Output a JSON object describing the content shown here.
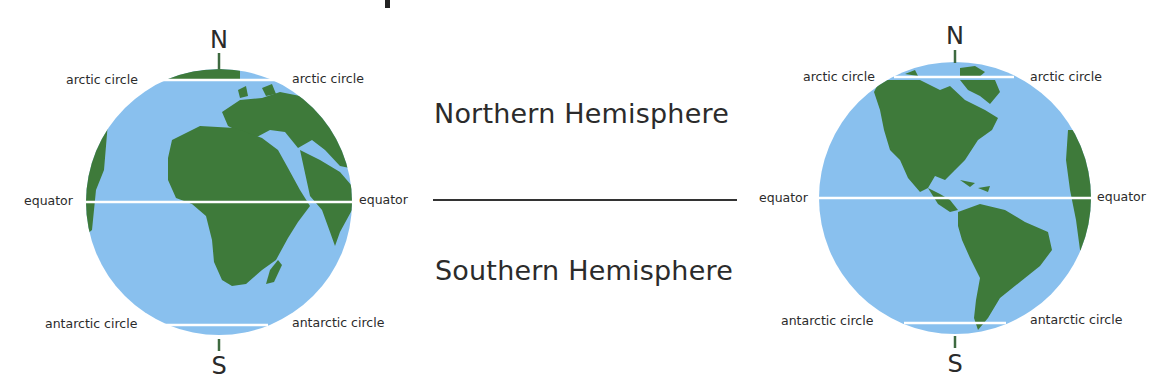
{
  "colors": {
    "ocean": "#89c0ee",
    "land": "#3e7a3a",
    "line": "#ffffff",
    "text": "#2b2b2b"
  },
  "left_globe": {
    "view": "Africa and Europe",
    "north_label": "N",
    "south_label": "S",
    "arctic_left": "arctic circle",
    "arctic_right": "arctic circle",
    "equator_left": "equator",
    "equator_right": "equator",
    "antarctic_left": "antarctic circle",
    "antarctic_right": "antarctic circle"
  },
  "right_globe": {
    "view": "North and South America",
    "north_label": "N",
    "south_label": "S",
    "arctic_left": "arctic circle",
    "arctic_right": "arctic circle",
    "equator_left": "equator",
    "equator_right": "equator",
    "antarctic_left": "antarctic circle",
    "antarctic_right": "antarctic circle"
  },
  "center": {
    "northern": "Northern Hemisphere",
    "southern": "Southern Hemisphere"
  }
}
